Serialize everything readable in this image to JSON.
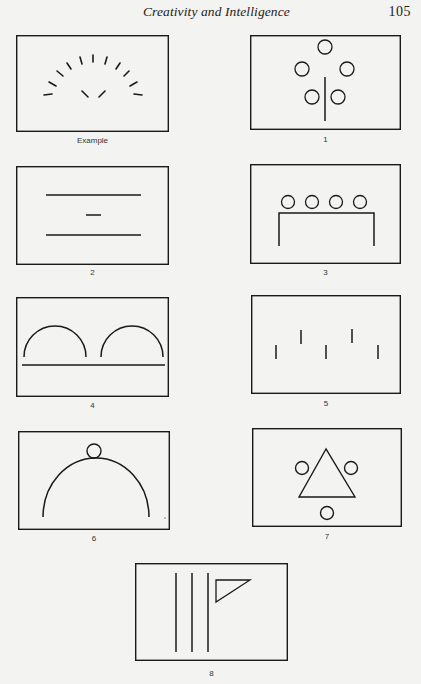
{
  "page": {
    "running_head": "Creativity and Intelligence",
    "page_number": "105"
  },
  "figures": [
    {
      "label": "Example",
      "description": "Arc of short radial dashes with two short dashes forming a V inside"
    },
    {
      "label": "1",
      "description": "Five circles arranged around a vertical line"
    },
    {
      "label": "2",
      "description": "Two long horizontal lines with a short dash between them"
    },
    {
      "label": "3",
      "description": "Four circles resting on an inverted U (table shape)"
    },
    {
      "label": "4",
      "description": "Two semicircular arcs above a long horizontal line"
    },
    {
      "label": "5",
      "description": "Five short vertical dashes in a zigzag row"
    },
    {
      "label": "6",
      "description": "A circle sitting on top of a large arc"
    },
    {
      "label": "7",
      "description": "A triangle surrounded by three circles"
    },
    {
      "label": "8",
      "description": "Three vertical lines with a small right triangle flag"
    }
  ]
}
